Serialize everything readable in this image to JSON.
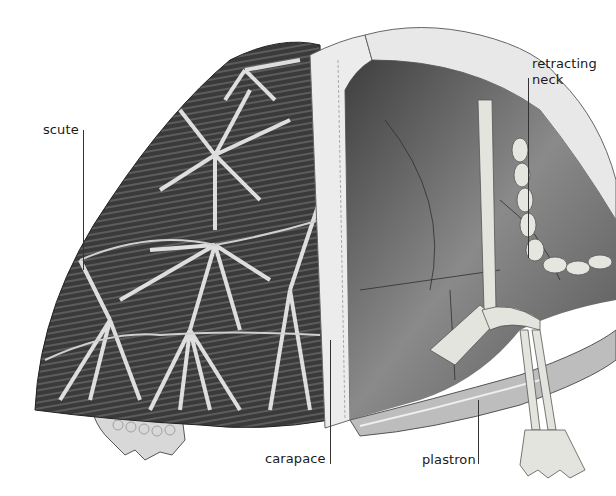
{
  "diagram": {
    "colors": {
      "background": "#ffffff",
      "shell_dark": "#3a3a3a",
      "shell_light": "#e6e6e6",
      "interior": "#6e6e6e",
      "bone": "#e2e2dc",
      "label_text": "#1a1a1a",
      "leader_line": "#333333"
    },
    "labels": [
      {
        "id": "scute",
        "text": "scute"
      },
      {
        "id": "retracting-neck",
        "line1": "retracting",
        "line2": "neck"
      },
      {
        "id": "carapace",
        "text": "carapace"
      },
      {
        "id": "plastron",
        "text": "plastron"
      }
    ]
  }
}
